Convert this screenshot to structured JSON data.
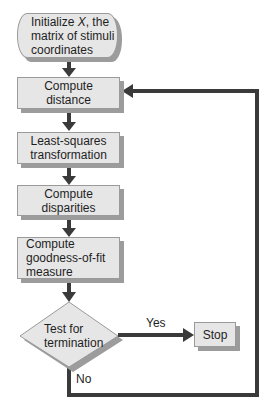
{
  "nodes": {
    "initialize": {
      "line1_pre": "Initialize ",
      "line1_var": "X",
      "line1_post": ", the",
      "line2": "matrix of stimuli",
      "line3": "coordinates"
    },
    "compute_distance": {
      "line1": "Compute",
      "line2": "distance"
    },
    "least_squares": {
      "line1": "Least-squares",
      "line2": "transformation"
    },
    "compute_disparities": {
      "line1": "Compute",
      "line2": "disparities"
    },
    "goodness_of_fit": {
      "line1": "Compute",
      "line2": "goodness-of-fit",
      "line3": "measure"
    },
    "test_termination": {
      "line1": "Test for",
      "line2": "termination"
    },
    "stop": {
      "label": "Stop"
    }
  },
  "edges": {
    "yes_label": "Yes",
    "no_label": "No"
  },
  "colors": {
    "box_fill": "#e6e6e6",
    "shadow": "#9c9c9c",
    "arrow": "#3a3a3a"
  }
}
